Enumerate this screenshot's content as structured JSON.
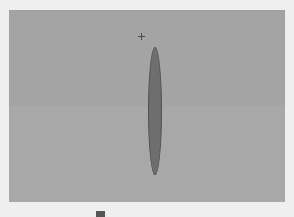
{
  "figure": {
    "panel": {
      "background": "#a4a4a4"
    },
    "shape": {
      "type": "ellipse",
      "fill": "#6e6e6e",
      "stroke": "#505050",
      "orientation": "vertical"
    },
    "marker": {
      "icon": "crosshair-icon"
    },
    "caption": {
      "text": ""
    }
  }
}
